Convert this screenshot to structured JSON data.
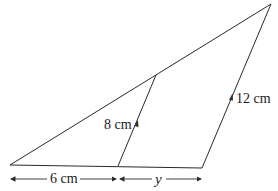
{
  "diagram": {
    "type": "similar-triangles",
    "labels": {
      "inner_side": "8 cm",
      "outer_side": "12 cm",
      "base_left": "6 cm",
      "base_right": "y"
    },
    "colors": {
      "stroke": "#2a2a2a",
      "background": "#ffffff"
    }
  }
}
